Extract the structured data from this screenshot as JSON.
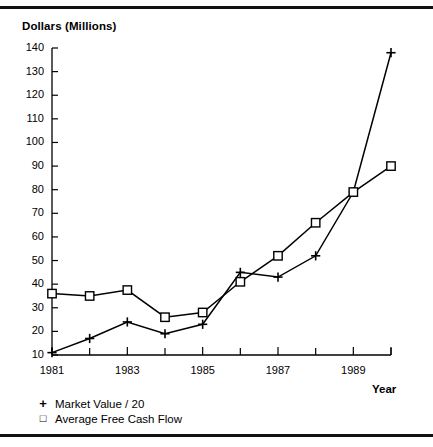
{
  "figure": {
    "has_top_rule": true,
    "has_bottom_rule": true,
    "ink_color": "#000000",
    "background": "#ffffff"
  },
  "chart_data": {
    "type": "line",
    "title": "",
    "ylabel": "Dollars (Millions)",
    "xlabel": "Year",
    "x": [
      1981,
      1982,
      1983,
      1984,
      1985,
      1986,
      1987,
      1988,
      1989,
      1990
    ],
    "xtick_labels": [
      "1981",
      "1983",
      "1985",
      "1987",
      "1989"
    ],
    "xticks_major": [
      1981,
      1983,
      1985,
      1987,
      1989
    ],
    "xticks_minor": [
      1982,
      1984,
      1986,
      1988,
      1990
    ],
    "xlim": [
      1981,
      1990
    ],
    "ylim": [
      10,
      140
    ],
    "yticks": [
      10,
      20,
      30,
      40,
      50,
      60,
      70,
      80,
      90,
      100,
      110,
      120,
      130,
      140
    ],
    "ytick_labels": [
      "10",
      "20",
      "30",
      "40",
      "50",
      "60",
      "70",
      "80",
      "90",
      "100",
      "110",
      "120",
      "130",
      "140"
    ],
    "grid": false,
    "legend_position": "below-left",
    "series": [
      {
        "name": "Market Value / 20",
        "marker": "plus",
        "marker_glyph": "+",
        "color": "#000000",
        "values": [
          11,
          17,
          24,
          19,
          23,
          45,
          43,
          52,
          79,
          138
        ]
      },
      {
        "name": "Average Free Cash Flow",
        "marker": "square",
        "marker_glyph": "□",
        "color": "#000000",
        "values": [
          36,
          35,
          37.5,
          26,
          28,
          41,
          52,
          66,
          79,
          90
        ]
      }
    ]
  }
}
